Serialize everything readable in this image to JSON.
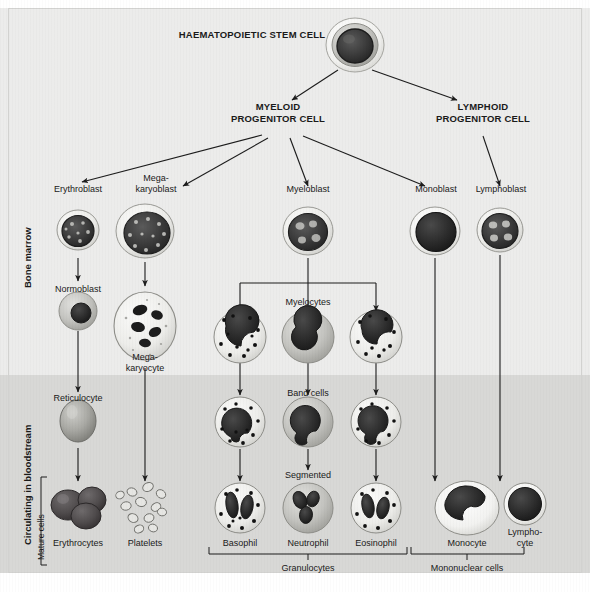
{
  "diagram": {
    "top_label": "HAEMATOPOIETIC STEM CELL",
    "progenitors": [
      {
        "label": "MYELOID\nPROGENITOR CELL"
      },
      {
        "label": "LYMPHOID\nPROGENITOR CELL"
      }
    ],
    "side_labels": {
      "marrow": "Bone marrow",
      "bloodstream": "Circulating in bloodstream",
      "mature": "Mature cells"
    },
    "blasts": [
      {
        "label": "Erythroblast"
      },
      {
        "label": "Mega-\nkaryoblast"
      },
      {
        "label": "Myeloblast"
      },
      {
        "label": "Monoblast"
      },
      {
        "label": "Lymphoblast"
      }
    ],
    "stage_labels": [
      {
        "label": "Normoblast"
      },
      {
        "label": "Mega-\nkaryocyte"
      },
      {
        "label": "Myelocytes"
      },
      {
        "label": "Band cells"
      },
      {
        "label": "Segmented"
      },
      {
        "label": "Reticulocyte"
      }
    ],
    "mature_cells": [
      {
        "label": "Erythrocytes"
      },
      {
        "label": "Platelets"
      },
      {
        "label": "Basophil"
      },
      {
        "label": "Neutrophil"
      },
      {
        "label": "Eosinophil"
      },
      {
        "label": "Monocyte"
      },
      {
        "label": "Lympho-\ncyte"
      }
    ],
    "group_brackets": [
      {
        "label": "Granulocytes"
      },
      {
        "label": "Mononuclear cells"
      }
    ],
    "colors": {
      "background_marrow": "#ececeb",
      "background_blood": "#d8d8d6",
      "text": "#1a1a1a",
      "arrow": "#1c1c1c",
      "cytoplasm_light": "#e8e8e6",
      "cytoplasm_mid": "#b9b9b6",
      "nucleus_dark": "#3a3a3a",
      "nucleus_deep": "#2b2b2b",
      "erythrocyte": "#555152"
    }
  }
}
